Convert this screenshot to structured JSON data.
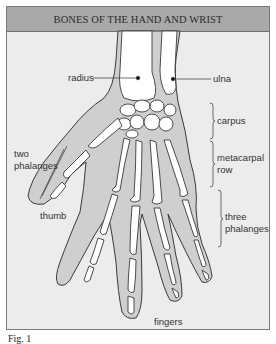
{
  "figure": {
    "title": "BONES OF THE HAND AND WRIST",
    "colors": {
      "header_bg": "#a9a9a9",
      "panel_bg": "#ececec",
      "hand_fill": "#cfcfcf",
      "bone_fill": "#ffffff",
      "outline": "#3a3a3a"
    },
    "labels": {
      "radius": "radius",
      "ulna": "ulna",
      "carpus": "carpus",
      "metacarpal_row_1": "metacarpal",
      "metacarpal_row_2": "row",
      "two_phalanges_1": "two",
      "two_phalanges_2": "phalanges",
      "thumb": "thumb",
      "three_phalanges_1": "three",
      "three_phalanges_2": "phalanges",
      "fingers": "fingers"
    },
    "caption": "Fig. 1"
  }
}
